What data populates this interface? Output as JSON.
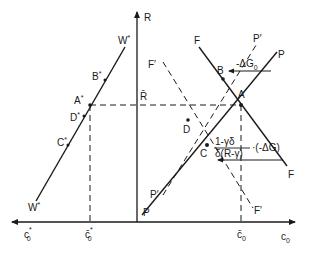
{
  "diagram": {
    "type": "economic-diagram",
    "axes": {
      "vertical_label": "R",
      "horizontal_right_label": "c",
      "horizontal_right_sub": "0",
      "horizontal_left_label": "c",
      "horizontal_left_sub": "0",
      "horizontal_left_sup": "*"
    },
    "reference_lines": {
      "r_bar": "R̄",
      "c_bar_0": "c̄",
      "c_bar_0_sub": "0",
      "c_bar_0_star": "c̄",
      "c_bar_0_star_sub": "0",
      "c_bar_0_star_sup": "*"
    },
    "curves": {
      "W_star_top": "W",
      "W_star_bottom": "W",
      "star": "*",
      "F_top": "F",
      "F_bottom": "F",
      "P_top": "P",
      "P_bottom": "P",
      "P_prime_top": "P′",
      "P_prime_bottom": "P′",
      "F_prime_top": "F′",
      "F_prime_bottom": "F′"
    },
    "points": {
      "A": "A",
      "B": "B",
      "C": "C",
      "D": "D",
      "A_star": "A",
      "B_star": "B",
      "C_star": "C",
      "D_star": "D"
    },
    "annotations": {
      "delta_G0": "-ΔG",
      "delta_G0_sub": "0",
      "fraction_numerator": "1-γδ",
      "fraction_denominator": "δ(R-γ)",
      "fraction_multiplier": "·(-ΔG)"
    },
    "colors": {
      "ink": "#1a1a1a",
      "background": "#ffffff"
    }
  }
}
